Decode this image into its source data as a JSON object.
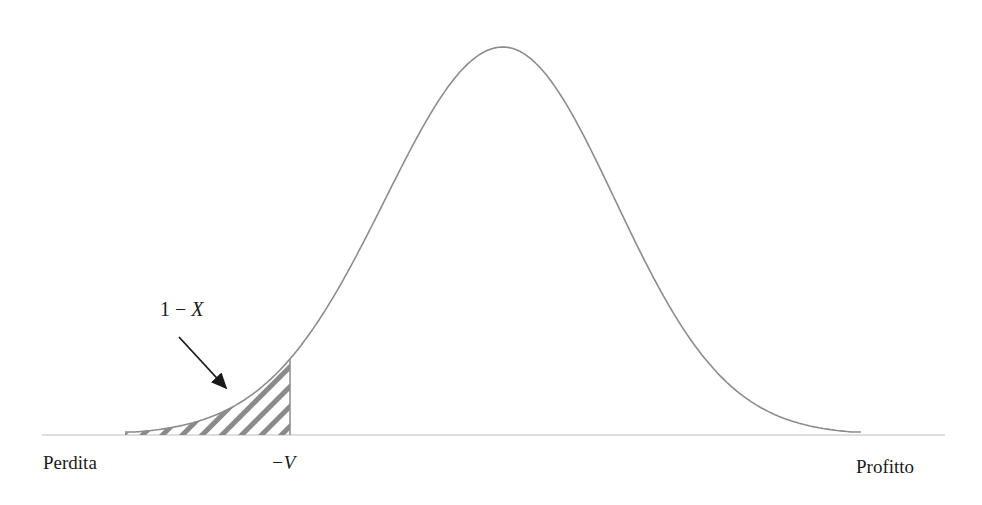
{
  "diagram": {
    "type": "normal-distribution-var",
    "labels": {
      "left_axis": "Perdita",
      "right_axis": "Profitto",
      "threshold": "−V",
      "tail_area_prefix": "1 − ",
      "tail_area_var": "X"
    },
    "colors": {
      "curve": "#8c8c8c",
      "baseline": "#bdbdbd",
      "hatch": "#8a8a8a",
      "arrow": "#1a1a1a",
      "text": "#1a1a1a"
    },
    "geometry": {
      "peak": {
        "x": 503,
        "y": 47
      },
      "baseline_y": 435,
      "baseline_x": [
        42,
        945
      ],
      "curve_x": [
        125,
        862
      ],
      "threshold_x": 290,
      "arrow_from": {
        "x": 179,
        "y": 337
      },
      "arrow_to": {
        "x": 228,
        "y": 390
      }
    }
  }
}
